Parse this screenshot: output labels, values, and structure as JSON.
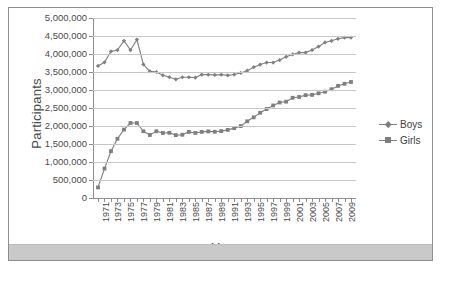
{
  "chart_data": {
    "type": "line",
    "title": "",
    "xlabel": "Year",
    "ylabel": "Participants",
    "ylim": [
      0,
      5000000
    ],
    "ytick_step": 500000,
    "ytick_labels": [
      "0",
      "500,000",
      "1,000,000",
      "1,500,000",
      "2,000,000",
      "2,500,000",
      "3,000,000",
      "3,500,000",
      "4,000,000",
      "4,500,000",
      "5,000,000"
    ],
    "ytick_values": [
      0,
      500000,
      1000000,
      1500000,
      2000000,
      2500000,
      3000000,
      3500000,
      4000000,
      4500000,
      5000000
    ],
    "grid": true,
    "grid_axis": "y",
    "legend_position": "right",
    "x": [
      1971,
      1972,
      1973,
      1974,
      1975,
      1976,
      1977,
      1978,
      1979,
      1980,
      1981,
      1982,
      1983,
      1984,
      1985,
      1986,
      1987,
      1988,
      1989,
      1990,
      1991,
      1992,
      1993,
      1994,
      1995,
      1996,
      1997,
      1998,
      1999,
      2000,
      2001,
      2002,
      2003,
      2004,
      2005,
      2006,
      2007,
      2008,
      2009,
      2010
    ],
    "xtick_labels": [
      "1971",
      "1973",
      "1975",
      "1977",
      "1979",
      "1981",
      "1983",
      "1985",
      "1987",
      "1989",
      "1991",
      "1993",
      "1995",
      "1997",
      "1999",
      "2001",
      "2003",
      "2005",
      "2007",
      "2009"
    ],
    "xtick_values": [
      1971,
      1973,
      1975,
      1977,
      1979,
      1981,
      1983,
      1985,
      1987,
      1989,
      1991,
      1993,
      1995,
      1997,
      1999,
      2001,
      2003,
      2005,
      2007,
      2009
    ],
    "series": [
      {
        "name": "Boys",
        "color": "#808080",
        "marker": "diamond",
        "values": [
          3666917,
          3770621,
          4070125,
          4109021,
          4367442,
          4109021,
          4400000,
          3709512,
          3517829,
          3500000,
          3409081,
          3355558,
          3298148,
          3354284,
          3354284,
          3344275,
          3428326,
          3425777,
          3416844,
          3426808,
          3406355,
          3429853,
          3472967,
          3536359,
          3634052,
          3706225,
          3763120,
          3763120,
          3832352,
          3921069,
          3988738,
          4038253,
          4038253,
          4110319,
          4206549,
          4321103,
          4367442,
          4422662,
          4455740,
          4455740
        ]
      },
      {
        "name": "Girls",
        "color": "#7f7f7f",
        "marker": "square",
        "values": [
          294015,
          817073,
          1300169,
          1645039,
          1900000,
          2083040,
          2083040,
          1854400,
          1750264,
          1853789,
          1807121,
          1810671,
          1747346,
          1757884,
          1836356,
          1807121,
          1836356,
          1849684,
          1839352,
          1858659,
          1892316,
          1940801,
          1997489,
          2130315,
          2240461,
          2367936,
          2472043,
          2570333,
          2652726,
          2675874,
          2784154,
          2806998,
          2856358,
          2865299,
          2908390,
          2953355,
          3021807,
          3114091,
          3172637,
          3222723
        ]
      }
    ]
  },
  "axis": {
    "y_title": "Participants",
    "x_title": "Year"
  },
  "legend": {
    "items": [
      {
        "label": "Boys",
        "marker": "diamond"
      },
      {
        "label": "Girls",
        "marker": "square"
      }
    ]
  }
}
